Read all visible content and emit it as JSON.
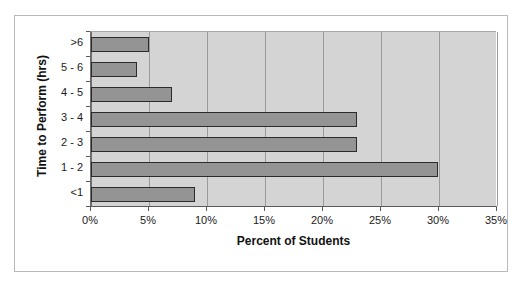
{
  "chart_data": {
    "type": "bar",
    "orientation": "horizontal",
    "title": "",
    "xlabel": "Percent of Students",
    "ylabel": "Time to Perform (hrs)",
    "categories": [
      "<1",
      "1 - 2",
      "2 - 3",
      "3 - 4",
      "4 - 5",
      "5 - 6",
      ">6"
    ],
    "values": [
      9,
      30,
      23,
      23,
      7,
      4,
      5
    ],
    "xtick_labels": [
      "0%",
      "5%",
      "10%",
      "15%",
      "20%",
      "25%",
      "30%",
      "35%"
    ],
    "xtick_values": [
      0,
      5,
      10,
      15,
      20,
      25,
      30,
      35
    ],
    "xlim": [
      0,
      35
    ],
    "grid": "vertical",
    "legend": "none",
    "bar_color": "#949494",
    "bar_border_color": "#2b2b2b",
    "plot_background": "#d4d4d4",
    "gridline_color": "#9a9a9a",
    "axis_color": "#5a5a5a",
    "figure_background": "#ffffff",
    "figure_border_color": "#b9b9b9"
  }
}
